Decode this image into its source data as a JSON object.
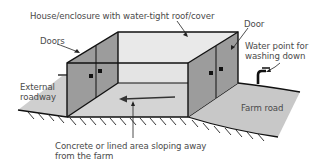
{
  "diagram": {
    "type": "isometric-illustration",
    "labels": {
      "house": "House/enclosure with water-tight roof/cover",
      "doors_left": "Doors",
      "door_right": "Door",
      "water_point_line1": "Water point for",
      "water_point_line2": "washing down",
      "external_roadway_line1": "External",
      "external_roadway_line2": "roadway",
      "farm_road": "Farm road",
      "concrete_line1": "Concrete or lined area sloping away",
      "concrete_line2": "from the farm"
    },
    "colors": {
      "outline": "#111111",
      "wall_dark": "#9a9a9a",
      "roof_light": "#e6e6e6",
      "floor": "#d2d2d2",
      "road": "#c8c8c8",
      "label_text": "#4a4a4a"
    },
    "flow_direction": "arrow pointing left, away from farm road toward external roadway"
  }
}
